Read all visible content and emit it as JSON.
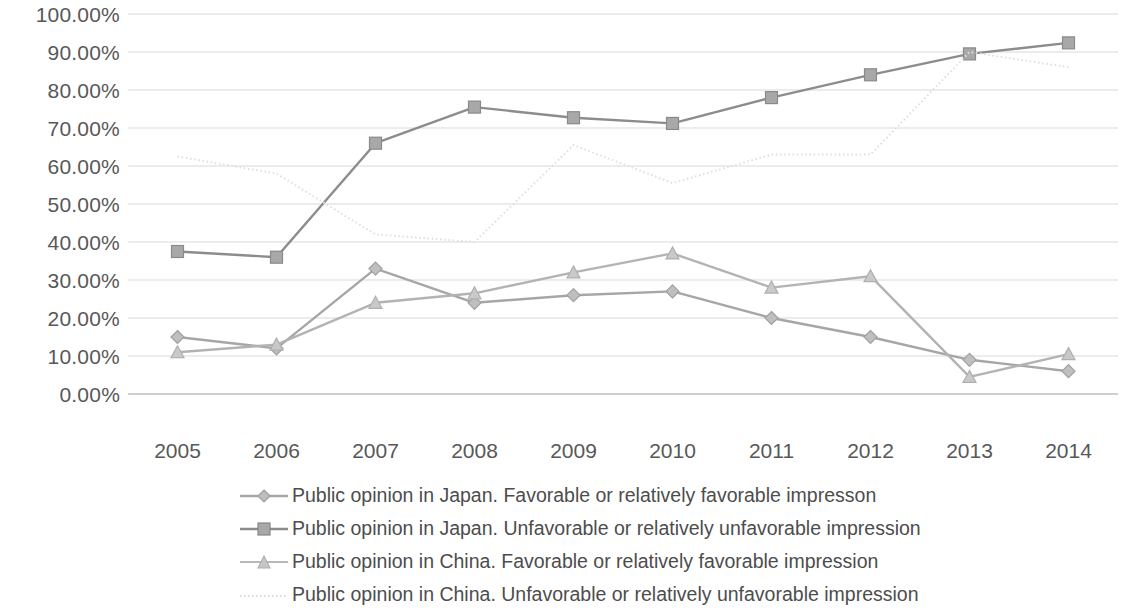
{
  "chart_data": {
    "type": "line",
    "title": "",
    "xlabel": "",
    "ylabel": "",
    "categories": [
      "2005",
      "2006",
      "2007",
      "2008",
      "2009",
      "2010",
      "2011",
      "2012",
      "2013",
      "2014"
    ],
    "ylim": [
      0,
      100
    ],
    "ytick_labels": [
      "0.00%",
      "10.00%",
      "20.00%",
      "30.00%",
      "40.00%",
      "50.00%",
      "60.00%",
      "70.00%",
      "80.00%",
      "90.00%",
      "100.00%"
    ],
    "ytick_values": [
      0,
      10,
      20,
      30,
      40,
      50,
      60,
      70,
      80,
      90,
      100
    ],
    "grid": true,
    "legend_position": "bottom",
    "series": [
      {
        "name": "Public opinion in Japan. Favorable or relatively favorable impresson",
        "marker": "diamond",
        "style": "solid",
        "color": "#a6a6a6",
        "values": [
          15.0,
          12.0,
          33.0,
          24.0,
          26.0,
          27.0,
          20.0,
          15.0,
          9.0,
          6.0
        ]
      },
      {
        "name": "Public opinion in Japan. Unfavorable or relatively unfavorable impression",
        "marker": "square",
        "style": "solid",
        "color": "#8c8c8c",
        "values": [
          37.5,
          36.0,
          66.0,
          75.5,
          72.7,
          71.2,
          78.0,
          84.0,
          89.5,
          92.4
        ]
      },
      {
        "name": "Public opinion in China. Favorable or relatively favorable impression",
        "marker": "triangle",
        "style": "solid",
        "color": "#b3b3b3",
        "values": [
          11.0,
          13.0,
          24.0,
          26.5,
          32.0,
          37.0,
          28.0,
          31.0,
          4.5,
          10.5
        ]
      },
      {
        "name": "Public opinion in China. Unfavorable or relatively unfavorable impression",
        "marker": "none",
        "style": "dotted",
        "color": "#e0e0e0",
        "values": [
          62.5,
          58.0,
          42.0,
          40.0,
          65.5,
          55.5,
          63.0,
          63.0,
          90.0,
          86.0
        ]
      }
    ]
  },
  "axes": {
    "y_labels": [
      "100.00%",
      "90.00%",
      "80.00%",
      "70.00%",
      "60.00%",
      "50.00%",
      "40.00%",
      "30.00%",
      "20.00%",
      "10.00%",
      "0.00%"
    ],
    "x_labels": [
      "2005",
      "2006",
      "2007",
      "2008",
      "2009",
      "2010",
      "2011",
      "2012",
      "2013",
      "2014"
    ]
  },
  "legend": {
    "items": [
      {
        "label": "Public opinion in Japan. Favorable or relatively favorable impresson",
        "marker": "diamond-marker",
        "color": "#a6a6a6"
      },
      {
        "label": "Public opinion in Japan. Unfavorable or relatively unfavorable impression",
        "marker": "square-marker",
        "color": "#8c8c8c"
      },
      {
        "label": "Public opinion in China. Favorable or relatively favorable impression",
        "marker": "triangle-marker",
        "color": "#b3b3b3"
      },
      {
        "label": "Public opinion in China. Unfavorable or relatively unfavorable impression",
        "marker": "dotted-line-marker",
        "color": "#dcdcdc"
      }
    ]
  },
  "colors": {
    "grid": "#d9d9d9",
    "axis": "#bfbfbf",
    "text": "#585858"
  }
}
